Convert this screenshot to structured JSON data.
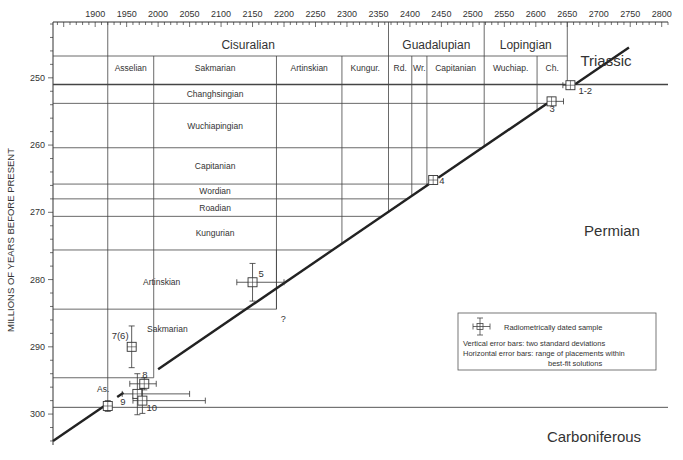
{
  "chart_data": {
    "type": "scatter",
    "title": "",
    "ylabel": "MILLIONS OF YEARS BEFORE PRESENT",
    "xlabel": "",
    "xlim": [
      1833,
      2810
    ],
    "ylim": [
      241.7,
      304.6
    ],
    "x_ticks": [
      1900,
      1950,
      2000,
      2050,
      2100,
      2150,
      2200,
      2250,
      2300,
      2350,
      2400,
      2450,
      2500,
      2550,
      2600,
      2650,
      2700,
      2750,
      2800
    ],
    "y_ticks": [
      250,
      260,
      270,
      280,
      290,
      300
    ],
    "grid": false,
    "series_headers": {
      "epochs": [
        {
          "label": "Cisuralian",
          "x0": 1920,
          "x1": 2366
        },
        {
          "label": "Guadalupian",
          "x0": 2366,
          "x1": 2518
        },
        {
          "label": "Lopingian",
          "x0": 2518,
          "x1": 2650
        }
      ],
      "stages_top": [
        {
          "label": "Asselian",
          "x0": 1920,
          "x1": 1993
        },
        {
          "label": "Sakmarian",
          "x0": 1993,
          "x1": 2188
        },
        {
          "label": "Artinskian",
          "x0": 2188,
          "x1": 2292
        },
        {
          "label": "Kungur.",
          "x0": 2292,
          "x1": 2366
        },
        {
          "label": "Rd.",
          "x0": 2366,
          "x1": 2403
        },
        {
          "label": "Wr.",
          "x0": 2403,
          "x1": 2427
        },
        {
          "label": "Capitanian",
          "x0": 2427,
          "x1": 2518
        },
        {
          "label": "Wuchiap.",
          "x0": 2518,
          "x1": 2602
        },
        {
          "label": "Ch.",
          "x0": 2602,
          "x1": 2650
        }
      ],
      "stages_left": [
        {
          "label": "Changhsingian",
          "y0": 251.0,
          "y1": 253.8
        },
        {
          "label": "Wuchiapingian",
          "y0": 253.8,
          "y1": 260.4
        },
        {
          "label": "Capitanian",
          "y0": 260.4,
          "y1": 265.8
        },
        {
          "label": "Wordian",
          "y0": 265.8,
          "y1": 268.0
        },
        {
          "label": "Roadian",
          "y0": 268.0,
          "y1": 270.6
        },
        {
          "label": "Kungurian",
          "y0": 270.6,
          "y1": 275.6
        },
        {
          "label": "Artinskian",
          "y0": 275.6,
          "y1": 284.4
        },
        {
          "label": "Sakmarian",
          "y0": 284.4,
          "y1": 294.6
        },
        {
          "label": "As.",
          "y0": 294.6,
          "y1": 299.0
        }
      ]
    },
    "periods": [
      {
        "label": "Triassic"
      },
      {
        "label": "Permian"
      },
      {
        "label": "Carboniferous"
      }
    ],
    "period_boundaries": {
      "permian_triassic": 251.0,
      "carboniferous_permian": 299.0
    },
    "best_fit_line": {
      "x": [
        1833,
        2748
      ],
      "y": [
        304.0,
        245.5
      ]
    },
    "samples": [
      {
        "label": "1-2",
        "x": 2655,
        "y": 251.1,
        "x_err": [
          2643,
          2660
        ],
        "y_err": [
          250.6,
          251.6
        ]
      },
      {
        "label": "3",
        "x": 2625,
        "y": 253.5,
        "x_err": [
          2620,
          2644
        ],
        "y_err": [
          253.1,
          253.9
        ]
      },
      {
        "label": "4",
        "x": 2437,
        "y": 265.2,
        "x_err": [
          2433,
          2441
        ],
        "y_err": [
          264.8,
          265.6
        ]
      },
      {
        "label": "5",
        "x": 2150,
        "y": 280.4,
        "x_err": [
          2125,
          2200
        ],
        "y_err": [
          277.6,
          283.2
        ]
      },
      {
        "label": "7(6)",
        "x": 1958,
        "y": 290.0,
        "x_err": [
          1952,
          1964
        ],
        "y_err": [
          286.9,
          293.1
        ]
      },
      {
        "label": "8",
        "x": 1978,
        "y": 295.5,
        "x_err": [
          1955,
          1997
        ],
        "y_err": [
          294.6,
          296.4
        ]
      },
      {
        "label": "9",
        "x": 1967,
        "y": 297.0,
        "x_err": [
          1943,
          2050
        ],
        "y_err": [
          294.0,
          300.1
        ]
      },
      {
        "label": "10",
        "x": 1975,
        "y": 298.0,
        "x_err": [
          1960,
          2075
        ],
        "y_err": [
          296.2,
          299.9
        ]
      },
      {
        "label": "",
        "x": 1920,
        "y": 298.8,
        "x_err": [
          1915,
          1925
        ],
        "y_err": [
          298.0,
          299.6
        ]
      }
    ],
    "annotations": [
      "?",
      "As."
    ],
    "legend": {
      "placement": "right",
      "symbol_label": "Radiometrically dated sample",
      "line1": "Vertical error bars:  two standard deviations",
      "line2": "Horizontal error bars:  range of placements within",
      "line3": "best-fit solutions"
    }
  }
}
